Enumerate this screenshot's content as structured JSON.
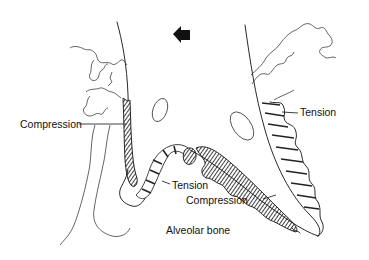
{
  "diagram": {
    "labels": {
      "compression_left": "Compression",
      "tension_right": "Tension",
      "tension_center": "Tension",
      "compression_bottom": "Compression",
      "alveolar_bone": "Alveolar bone"
    },
    "direction_arrow": {
      "icon": "left-arrow-icon",
      "meaning": "direction of applied force"
    },
    "colors": {
      "ink": "#111111",
      "background": "#ffffff"
    }
  }
}
